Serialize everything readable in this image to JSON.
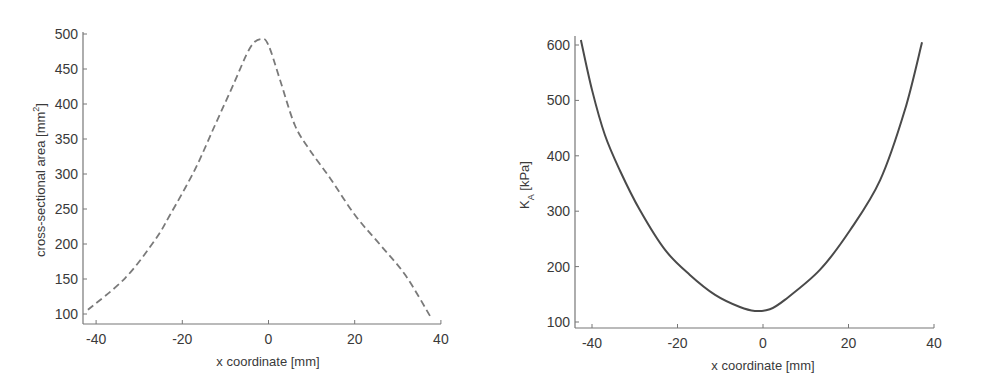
{
  "chart_data": [
    {
      "type": "line",
      "title": "",
      "xlabel": "x coordinate [mm]",
      "ylabel": "cross-sectional area [mm^2]",
      "ylabel_main": "cross-sectional area [mm",
      "ylabel_sup": "2",
      "ylabel_tail": "]",
      "xlim": [
        -42,
        40
      ],
      "ylim": [
        88,
        500
      ],
      "x_ticks": [
        -40,
        -20,
        0,
        20,
        40
      ],
      "x_tick_labels": [
        "-40",
        "-20",
        "0",
        "20",
        "40"
      ],
      "y_ticks": [
        100,
        150,
        200,
        250,
        300,
        350,
        400,
        450,
        500
      ],
      "y_tick_labels": [
        "100",
        "150",
        "200",
        "250",
        "300",
        "350",
        "400",
        "450",
        "500"
      ],
      "grid": false,
      "legend": null,
      "line_style": "dashed",
      "series": [
        {
          "name": "cross-sectional area",
          "x": [
            -41.9,
            -33.3,
            -26.3,
            -22.9,
            -17.1,
            -12.4,
            -8.2,
            -4.3,
            -1.7,
            0,
            2.7,
            6.1,
            9.6,
            14.3,
            20.1,
            25.9,
            31.7,
            37.5
          ],
          "y": [
            106,
            151,
            206,
            241,
            306,
            370,
            427,
            480,
            493,
            484,
            434,
            370,
            334,
            294,
            241,
            199,
            156,
            97
          ]
        }
      ]
    },
    {
      "type": "line",
      "title": "",
      "xlabel": "x coordinate [mm]",
      "ylabel": "K_A [kPa]",
      "ylabel_main": "K",
      "ylabel_sub": "A",
      "ylabel_tail": " [kPa]",
      "xlim": [
        -44,
        40
      ],
      "ylim": [
        90,
        610
      ],
      "x_ticks": [
        -40,
        -20,
        0,
        20,
        40
      ],
      "x_tick_labels": [
        "-40",
        "-20",
        "0",
        "20",
        "40"
      ],
      "y_ticks": [
        100,
        200,
        300,
        400,
        500,
        600
      ],
      "y_tick_labels": [
        "100",
        "200",
        "300",
        "400",
        "500",
        "600"
      ],
      "grid": false,
      "legend": null,
      "line_style": "solid",
      "series": [
        {
          "name": "K_A",
          "x": [
            -42.6,
            -40,
            -37,
            -33.5,
            -28.8,
            -22.9,
            -17.1,
            -11.2,
            -5.4,
            -1.9,
            1.6,
            5.1,
            13.3,
            20.4,
            27.4,
            33.2,
            37.2
          ],
          "y": [
            609,
            519,
            438,
            374,
            302,
            230,
            185,
            149,
            127,
            120,
            123,
            140,
            194,
            266,
            356,
            483,
            605
          ]
        }
      ]
    }
  ]
}
